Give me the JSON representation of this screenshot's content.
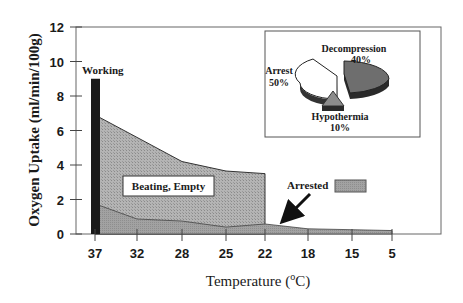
{
  "chart_data": {
    "type": "area",
    "title": "",
    "xlabel": "Temperature (°C)",
    "xlabel_text": "Temperature (",
    "xlabel_sup": "o",
    "xlabel_end": "C)",
    "ylabel": "Oxygen Uptake (ml/min/100g)",
    "ylim": [
      0,
      12
    ],
    "yticks": [
      "0",
      "2",
      "4",
      "6",
      "8",
      "10",
      "12"
    ],
    "categories": [
      "37",
      "32",
      "28",
      "25",
      "22",
      "18",
      "15",
      "5"
    ],
    "grid": false,
    "series": [
      {
        "name": "Working",
        "type": "bar",
        "values": [
          9.0,
          null,
          null,
          null,
          null,
          null,
          null,
          null
        ],
        "color": "#1a1a1a"
      },
      {
        "name": "Beating, Empty",
        "type": "area",
        "values": [
          6.9,
          5.6,
          4.2,
          3.65,
          3.5,
          null,
          null,
          null
        ],
        "color": "#a8a8a8"
      },
      {
        "name": "Arrested",
        "type": "area",
        "values": [
          1.75,
          0.87,
          0.75,
          0.4,
          0.58,
          0.3,
          0.25,
          0.2
        ],
        "color": "#9a9a9a"
      }
    ],
    "annotations": [
      {
        "text": "Working",
        "target": "37"
      },
      {
        "text": "Beating, Empty",
        "boxed": true
      },
      {
        "text": "Arrested",
        "arrow_to": "20",
        "legend_swatch": true
      }
    ],
    "inset": {
      "type": "pie",
      "slices": [
        {
          "label": "Decompression",
          "pct_label": "40%",
          "value": 40,
          "color": "#6e6e6e"
        },
        {
          "label": "Hypothermia",
          "pct_label": "10%",
          "value": 10,
          "color": "#8c8c8c"
        },
        {
          "label": "Arrest",
          "pct_label": "50%",
          "value": 50,
          "color": "#ffffff"
        }
      ]
    }
  }
}
